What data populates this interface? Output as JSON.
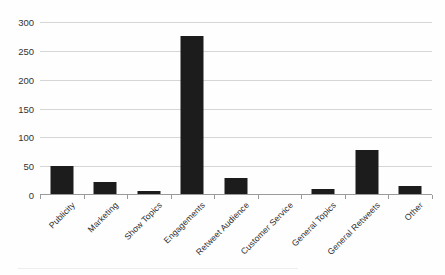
{
  "chart_data": {
    "type": "bar",
    "title": "",
    "subtitle": "",
    "xlabel": "",
    "ylabel": "",
    "categories": [
      "Publicity",
      "Marketing",
      "Show Topics",
      "Engagements",
      "Retweet Audience",
      "Customer Service",
      "General Topics",
      "General Retweets",
      "Other"
    ],
    "values": [
      51,
      23,
      7,
      275,
      29,
      0,
      10,
      78,
      15
    ],
    "ylim": [
      0,
      300
    ],
    "yticks": [
      0,
      50,
      100,
      150,
      200,
      250,
      300
    ],
    "ytick_labels": [
      "0",
      "50",
      "100",
      "150",
      "200",
      "250",
      "300"
    ],
    "grid": true,
    "legend": false,
    "legend_position": "none",
    "bar_color": "#1c1c1c",
    "gridline_color": "#d6d6d6",
    "axis_color": "#9a9a9a",
    "background_color": "#fefefe",
    "label_rotation_deg": -45
  }
}
